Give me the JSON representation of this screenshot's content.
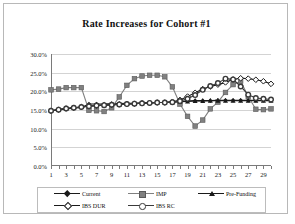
{
  "chart_data": {
    "type": "line",
    "title": "Rate Increases for Cohort #1",
    "xlabel": "",
    "ylabel": "",
    "ylim": [
      0,
      30
    ],
    "ytick_labels": [
      "0.0%",
      "5.0%",
      "10.0%",
      "15.0%",
      "20.0%",
      "25.0%",
      "30.0%"
    ],
    "ytick_values": [
      0,
      5,
      10,
      15,
      20,
      25,
      30
    ],
    "xlim": [
      1,
      30
    ],
    "xtick_labels": [
      "1",
      "3",
      "5",
      "7",
      "9",
      "11",
      "13",
      "15",
      "17",
      "19",
      "21",
      "23",
      "25",
      "27",
      "29"
    ],
    "xtick_values": [
      1,
      3,
      5,
      7,
      9,
      11,
      13,
      15,
      17,
      19,
      21,
      23,
      25,
      27,
      29
    ],
    "x": [
      1,
      2,
      3,
      4,
      5,
      6,
      7,
      8,
      9,
      10,
      11,
      12,
      13,
      14,
      15,
      16,
      17,
      18,
      19,
      20,
      21,
      22,
      23,
      24,
      25,
      26,
      27,
      28,
      29,
      30
    ],
    "grid": true,
    "legend_position": "bottom",
    "series": [
      {
        "name": "Current",
        "marker": "diamond",
        "color": "#1a1a1a",
        "values": [
          14.8,
          15.0,
          15.3,
          15.5,
          15.7,
          16.6,
          16.6,
          16.6,
          16.7,
          16.7,
          16.8,
          16.8,
          16.9,
          16.9,
          17.0,
          17.0,
          17.1,
          17.3,
          17.4,
          17.5,
          17.5,
          17.5,
          17.6,
          17.6,
          17.6,
          17.6,
          17.6,
          17.6,
          17.6,
          17.6
        ]
      },
      {
        "name": "IMP",
        "marker": "square",
        "color": "#808080",
        "values": [
          20.4,
          20.6,
          21.0,
          21.0,
          21.0,
          14.9,
          14.8,
          14.6,
          15.6,
          18.5,
          21.6,
          23.4,
          24.1,
          24.3,
          24.3,
          23.9,
          21.2,
          16.6,
          13.3,
          10.7,
          12.3,
          15.3,
          17.1,
          19.7,
          21.8,
          22.7,
          18.6,
          15.2,
          15.1,
          15.3
        ]
      },
      {
        "name": "Pre-Funding",
        "marker": "triangle",
        "color": "#1a1a1a",
        "values": [
          14.8,
          15.1,
          15.4,
          15.6,
          15.8,
          16.0,
          16.2,
          16.3,
          16.4,
          16.5,
          16.6,
          16.7,
          16.8,
          16.9,
          17.0,
          17.0,
          17.1,
          17.2,
          17.3,
          17.4,
          17.4,
          17.5,
          17.5,
          17.5,
          17.5,
          17.5,
          17.5,
          17.5,
          17.5,
          17.5
        ]
      },
      {
        "name": "IBS DUR",
        "marker": "open-diamond",
        "color": "#1a1a1a",
        "values": [
          14.8,
          15.1,
          15.4,
          15.6,
          15.8,
          16.0,
          16.2,
          16.3,
          16.4,
          16.5,
          16.6,
          16.7,
          16.8,
          16.9,
          17.0,
          17.0,
          17.2,
          17.7,
          18.6,
          19.6,
          20.6,
          21.3,
          21.8,
          22.4,
          23.2,
          23.5,
          23.4,
          23.1,
          22.7,
          22.0
        ]
      },
      {
        "name": "IBS RC",
        "marker": "open-circle",
        "color": "#3a3a3a",
        "values": [
          14.8,
          15.1,
          15.4,
          15.6,
          15.8,
          16.0,
          16.2,
          16.3,
          16.4,
          16.5,
          16.6,
          16.7,
          16.8,
          16.9,
          17.0,
          17.0,
          17.1,
          17.4,
          18.0,
          19.0,
          20.4,
          21.4,
          22.2,
          23.4,
          23.2,
          21.3,
          19.1,
          18.2,
          18.0,
          17.8
        ]
      }
    ]
  },
  "legend": {
    "items": [
      {
        "label": "Current",
        "marker": "diamond",
        "color": "#1a1a1a"
      },
      {
        "label": "IMP",
        "marker": "square",
        "color": "#808080"
      },
      {
        "label": "Pre-Funding",
        "marker": "triangle",
        "color": "#1a1a1a"
      },
      {
        "label": "IBS DUR",
        "marker": "open-diamond",
        "color": "#1a1a1a"
      },
      {
        "label": "IBS RC",
        "marker": "open-circle",
        "color": "#3a3a3a"
      }
    ]
  }
}
